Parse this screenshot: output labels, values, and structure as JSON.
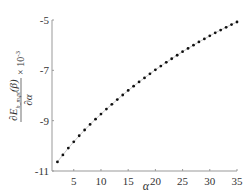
{
  "chart_data": {
    "type": "line",
    "title": "",
    "xlabel": "α",
    "ylabel": "∂E_{h_m,pt}(β)/∂α × 10^-3",
    "ylabel_parts": {
      "numerator": "∂E",
      "sub": "h_m,pt",
      "arg": "(β)",
      "denominator": "∂α",
      "scale": "× 10",
      "scale_exp": "-3"
    },
    "xlim": [
      1,
      35
    ],
    "ylim": [
      -11,
      -5
    ],
    "xticks": [
      5,
      10,
      15,
      20,
      25,
      30,
      35
    ],
    "yticks": [
      -11,
      -9,
      -7,
      -5
    ],
    "grid": false,
    "legend": null,
    "marker": "dot",
    "series": [
      {
        "name": "∂E/∂α",
        "x": [
          2,
          3,
          4,
          5,
          6,
          7,
          8,
          9,
          10,
          11,
          12,
          13,
          14,
          15,
          16,
          17,
          18,
          19,
          20,
          21,
          22,
          23,
          24,
          25,
          26,
          27,
          28,
          29,
          30,
          31,
          32,
          33,
          34,
          35
        ],
        "values": [
          -10.64,
          -10.36,
          -10.09,
          -9.84,
          -9.6,
          -9.37,
          -9.15,
          -8.94,
          -8.74,
          -8.54,
          -8.35,
          -8.16,
          -7.98,
          -7.8,
          -7.63,
          -7.46,
          -7.3,
          -7.14,
          -6.98,
          -6.83,
          -6.68,
          -6.54,
          -6.4,
          -6.26,
          -6.13,
          -6.0,
          -5.87,
          -5.75,
          -5.63,
          -5.51,
          -5.4,
          -5.29,
          -5.18,
          -5.08
        ]
      }
    ]
  }
}
